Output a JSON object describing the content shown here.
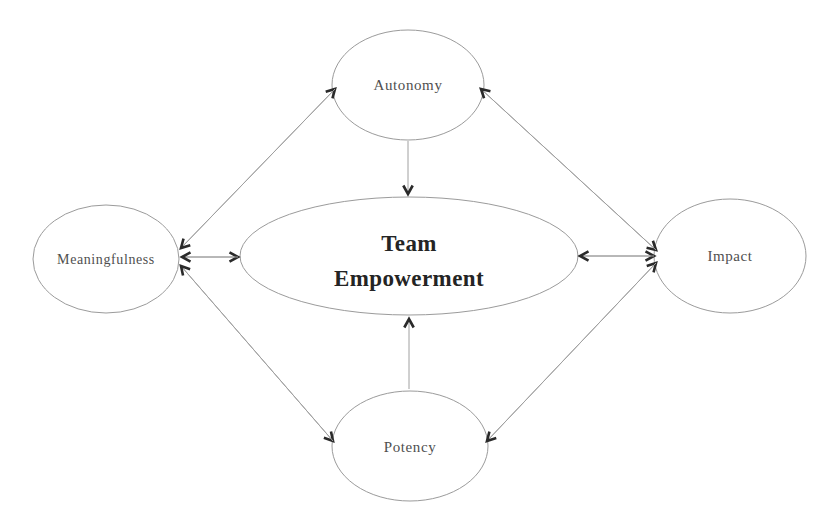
{
  "diagram": {
    "type": "concept-model",
    "background_color": "#ffffff",
    "ellipse_stroke_color": "#9b9b9b",
    "line_color": "#a0a0a0",
    "arrow_color": "#2a2a2a",
    "label_text_color": "#4f4f4f",
    "center_text_color": "#242424",
    "nodes": [
      {
        "id": "team-empowerment",
        "label_line1": "Team",
        "label_line2": "Empowerment",
        "shape": "ellipse",
        "emphasis": "bold",
        "position": "center"
      },
      {
        "id": "autonomy",
        "label": "Autonomy",
        "shape": "ellipse",
        "position": "top"
      },
      {
        "id": "meaningfulness",
        "label": "Meaningfulness",
        "shape": "ellipse",
        "position": "left"
      },
      {
        "id": "impact",
        "label": "Impact",
        "shape": "ellipse",
        "position": "right"
      },
      {
        "id": "potency",
        "label": "Potency",
        "shape": "ellipse",
        "position": "bottom"
      }
    ],
    "edges": [
      {
        "from": "Meaningfulness",
        "to": "Autonomy",
        "type": "bidirectional"
      },
      {
        "from": "Autonomy",
        "to": "Impact",
        "type": "bidirectional"
      },
      {
        "from": "Meaningfulness",
        "to": "Potency",
        "type": "bidirectional"
      },
      {
        "from": "Potency",
        "to": "Impact",
        "type": "bidirectional"
      },
      {
        "from": "Meaningfulness",
        "to": "Team Empowerment",
        "type": "bidirectional"
      },
      {
        "from": "Team Empowerment",
        "to": "Impact",
        "type": "bidirectional"
      },
      {
        "from": "Autonomy",
        "to": "Team Empowerment",
        "type": "directed"
      },
      {
        "from": "Potency",
        "to": "Team Empowerment",
        "type": "directed"
      }
    ]
  }
}
